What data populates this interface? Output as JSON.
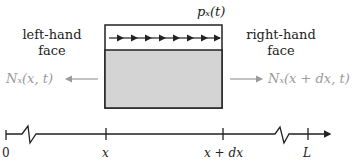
{
  "diagram": {
    "load_label": "pₓ(t)",
    "left_face": {
      "line1": "left-hand",
      "line2": "face"
    },
    "right_face": {
      "line1": "right-hand",
      "line2": "face"
    },
    "left_force": "Nₓ(x, t)",
    "right_force": "Nₓ(x + dx, t)",
    "distributed_load_arrows": 8,
    "colors": {
      "element_fill": "#d4d4d4",
      "outline": "#222222",
      "force_gray": "#9a9a9a"
    }
  },
  "axis": {
    "ticks": [
      {
        "label": "0",
        "x": 6
      },
      {
        "label": "x",
        "x": 106
      },
      {
        "label": "x + dx",
        "x": 223
      },
      {
        "label": "L",
        "x": 308
      }
    ],
    "breaks": 2
  }
}
